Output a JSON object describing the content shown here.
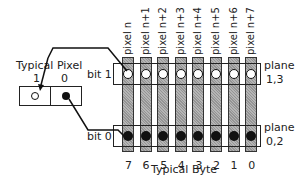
{
  "diagram": {
    "pixel_box": {
      "title": "Typical Pixel",
      "bit_labels": [
        "1",
        "0"
      ]
    },
    "columns": [
      {
        "pixel_label": "pixel n",
        "bit_index": "7"
      },
      {
        "pixel_label": "pixel n+1",
        "bit_index": "6"
      },
      {
        "pixel_label": "pixel n+2",
        "bit_index": "5"
      },
      {
        "pixel_label": "pixel n+3",
        "bit_index": "4"
      },
      {
        "pixel_label": "pixel n+4",
        "bit_index": "3"
      },
      {
        "pixel_label": "pixel n+5",
        "bit_index": "2"
      },
      {
        "pixel_label": "pixel n+6",
        "bit_index": "1"
      },
      {
        "pixel_label": "pixel n+7",
        "bit_index": "0"
      }
    ],
    "rows": [
      {
        "bit_label": "bit 1",
        "plane_label_1": "plane",
        "plane_label_2": "1,3",
        "dot": "open"
      },
      {
        "bit_label": "bit 0",
        "plane_label_1": "plane",
        "plane_label_2": "0,2",
        "dot": "filled"
      }
    ],
    "byte_label": "Typical Byte"
  }
}
